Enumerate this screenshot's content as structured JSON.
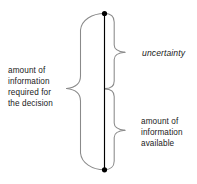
{
  "figure": {
    "axis": {
      "name": "vertical-information-axis",
      "top_marker": "filled-dot",
      "bottom_marker": "filled-dot",
      "line_color": "#000000"
    },
    "braces": [
      {
        "id": "left-brace",
        "side": "left",
        "spans": "full",
        "label": "amount of\ninformation\nrequired for\nthe decision",
        "label_lines": [
          "amount of",
          "information",
          "required for",
          "the decision"
        ],
        "stroke_color": "#8a8a8a"
      },
      {
        "id": "right-brace-upper",
        "side": "right",
        "spans": "upper",
        "label": "uncertainty",
        "label_lines": [
          "uncertainty"
        ],
        "emphasis": "italic",
        "stroke_color": "#8a8a8a"
      },
      {
        "id": "right-brace-lower",
        "side": "right",
        "spans": "lower",
        "label": "amount of\ninformation\navailable",
        "label_lines": [
          "amount of",
          "information",
          "available"
        ],
        "stroke_color": "#8a8a8a"
      }
    ],
    "labels": {
      "left": "amount of\ninformation\nrequired for\nthe decision",
      "uncertainty": "uncertainty",
      "available": "amount of\ninformation\navailable"
    },
    "colors": {
      "background": "#ffffff",
      "text": "#1a1a1a",
      "brace_stroke": "#8a8a8a",
      "axis_stroke": "#000000"
    }
  }
}
